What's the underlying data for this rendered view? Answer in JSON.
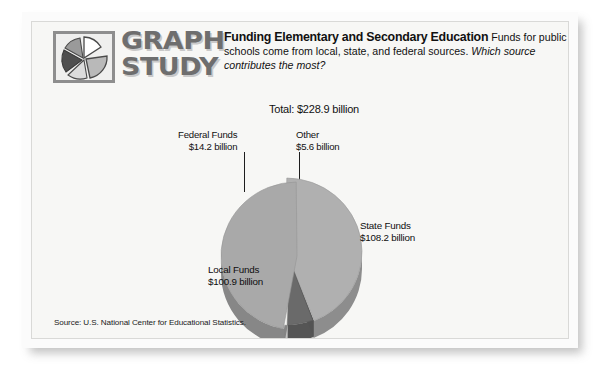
{
  "card": {
    "logo": {
      "icon": "pie-chart-logo-icon",
      "word_line1": "GRAPH",
      "word_line2": "STUDY"
    },
    "header": {
      "title": "Funding Elementary and Secondary Education",
      "body": "Funds for public schools come from local, state, and federal sources.",
      "question": "Which source contributes the most?"
    },
    "source_note": "Source: U.S. National Center for Educational Statistics."
  },
  "chart_data": {
    "type": "pie",
    "title": "Funding Elementary and Secondary Education",
    "total_label": "Total: $228.9 billion",
    "total_value": 228.9,
    "units": "billion USD",
    "legend_position": "callouts",
    "categories": [
      "State Funds",
      "Local Funds",
      "Federal Funds",
      "Other"
    ],
    "values": [
      108.2,
      100.9,
      14.2,
      5.6
    ],
    "labels": [
      {
        "name": "State Funds",
        "amount": "$108.2 billion",
        "value": 108.2,
        "color": "#a9a9a9",
        "exploded": true
      },
      {
        "name": "Local Funds",
        "amount": "$100.9 billion",
        "value": 100.9,
        "color": "#b0b0b0",
        "exploded": false
      },
      {
        "name": "Federal Funds",
        "amount": "$14.2 billion",
        "value": 14.2,
        "color": "#6a6a6a",
        "exploded": false
      },
      {
        "name": "Other",
        "amount": "$5.6 billion",
        "value": 5.6,
        "color": "#f4f4f2",
        "exploded": false
      }
    ],
    "callouts": {
      "federal_name": "Federal Funds",
      "federal_amount": "$14.2 billion",
      "other_name": "Other",
      "other_amount": "$5.6 billion",
      "state_name": "State Funds",
      "state_amount": "$108.2 billion",
      "local_name": "Local Funds",
      "local_amount": "$100.9 billion"
    },
    "colors": {
      "state": "#a9a9a9",
      "local": "#b0b0b0",
      "federal": "#6a6a6a",
      "other": "#f4f4f2",
      "depth": "#8f8f8f",
      "background": "#f7f7f5"
    }
  }
}
